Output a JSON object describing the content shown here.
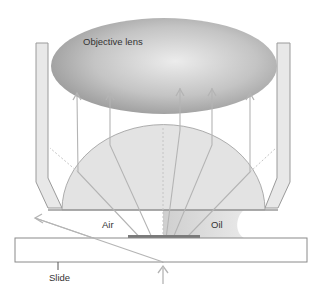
{
  "labels": {
    "objective": "Objective lens",
    "air": "Air",
    "oil": "Oil",
    "slide": "Slide"
  },
  "colors": {
    "background": "#ffffff",
    "lens_dark": "#9a9a9a",
    "lens_light": "#e6e6e6",
    "housing_fill": "#e8e8e8",
    "housing_stroke": "#9a9a9a",
    "dome_fill": "#e3e3e3",
    "ray": "#b8b8b8",
    "oil": "#dcdcdc",
    "coverslip": "#7a7a7a",
    "slide_stroke": "#8a8a8a",
    "text": "#333333"
  },
  "rays": {
    "vertical_x": [
      77,
      110,
      180,
      212,
      250
    ],
    "source_point": [
      163,
      262
    ]
  }
}
